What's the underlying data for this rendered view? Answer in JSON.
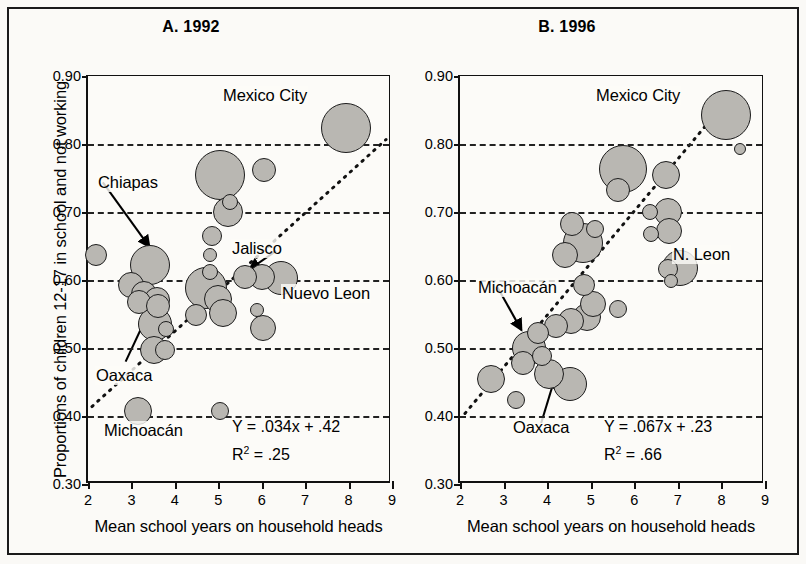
{
  "figure": {
    "ylabel": "Proportions of children 12-17 in school and not working",
    "bg_color": "#fbfaf7",
    "bubble_fill": "#b9b7b2",
    "bubble_stroke": "#1d1d1d"
  },
  "panels": {
    "a": {
      "title": "A. 1992",
      "xlabel": "Mean school years on household heads",
      "equation": "Y = .034x + .42",
      "r2_prefix": "R",
      "r2_exp": "2",
      "r2_value": " = .25",
      "ytick_labels": [
        "0.90",
        "0.80",
        "0.70",
        "0.60",
        "0.50",
        "0.40",
        "0.30"
      ],
      "xtick_labels": [
        "2",
        "3",
        "4",
        "5",
        "6",
        "7",
        "8",
        "9"
      ],
      "annotations": [
        {
          "label": "Mexico City"
        },
        {
          "label": "Chiapas"
        },
        {
          "label": "Jalisco"
        },
        {
          "label": "Nuevo Leon"
        },
        {
          "label": "Oaxaca"
        },
        {
          "label": "Michoacán"
        }
      ]
    },
    "b": {
      "title": "B. 1996",
      "xlabel": "Mean school years on household heads",
      "equation": "Y = .067x + .23",
      "r2_prefix": "R",
      "r2_exp": "2",
      "r2_value": " = .66",
      "ytick_labels": [
        "0.90",
        "0.80",
        "0.70",
        "0.60",
        "0.50",
        "0.40",
        "0.30"
      ],
      "xtick_labels": [
        "2",
        "3",
        "4",
        "5",
        "6",
        "7",
        "8",
        "9"
      ],
      "annotations": [
        {
          "label": "Mexico City"
        },
        {
          "label": "N. Leon"
        },
        {
          "label": "Michoacán"
        },
        {
          "label": "Oaxaca"
        }
      ]
    }
  },
  "chart_data": [
    {
      "type": "scatter",
      "id": "panel-a",
      "title": "A. 1992",
      "xlabel": "Mean school years on household heads",
      "ylabel": "Proportions of children 12-17 in school and not working",
      "xlim": [
        2,
        9
      ],
      "ylim": [
        0.3,
        0.9
      ],
      "xticks": [
        2,
        3,
        4,
        5,
        6,
        7,
        8,
        9
      ],
      "yticks": [
        0.3,
        0.4,
        0.5,
        0.6,
        0.7,
        0.8,
        0.9
      ],
      "grid": "horizontal-dashed",
      "legend": "none",
      "marker": "bubble (area = population size)",
      "regression": {
        "equation": "Y = .034x + .42",
        "slope": 0.034,
        "intercept": 0.42,
        "r2": 0.25,
        "style": "dotted"
      },
      "points": [
        {
          "x": 7.95,
          "y": 0.823,
          "r": 25,
          "label": "Mexico City"
        },
        {
          "x": 5.05,
          "y": 0.755,
          "r": 25
        },
        {
          "x": 6.05,
          "y": 0.762,
          "r": 12
        },
        {
          "x": 5.28,
          "y": 0.715,
          "r": 8
        },
        {
          "x": 5.22,
          "y": 0.7,
          "r": 15
        },
        {
          "x": 4.85,
          "y": 0.665,
          "r": 10
        },
        {
          "x": 4.8,
          "y": 0.637,
          "r": 7
        },
        {
          "x": 2.18,
          "y": 0.637,
          "r": 11
        },
        {
          "x": 3.42,
          "y": 0.622,
          "r": 20
        },
        {
          "x": 4.8,
          "y": 0.612,
          "r": 8
        },
        {
          "x": 5.62,
          "y": 0.605,
          "r": 12
        },
        {
          "x": 6.0,
          "y": 0.605,
          "r": 13
        },
        {
          "x": 6.45,
          "y": 0.603,
          "r": 17
        },
        {
          "x": 4.72,
          "y": 0.588,
          "r": 21,
          "label": "Jalisco"
        },
        {
          "x": 3.0,
          "y": 0.592,
          "r": 13
        },
        {
          "x": 3.28,
          "y": 0.58,
          "r": 13
        },
        {
          "x": 3.18,
          "y": 0.568,
          "r": 12,
          "label": "Chiapas"
        },
        {
          "x": 3.58,
          "y": 0.57,
          "r": 13
        },
        {
          "x": 3.62,
          "y": 0.562,
          "r": 12
        },
        {
          "x": 5.0,
          "y": 0.572,
          "r": 14
        },
        {
          "x": 5.12,
          "y": 0.552,
          "r": 14
        },
        {
          "x": 4.48,
          "y": 0.548,
          "r": 11
        },
        {
          "x": 5.88,
          "y": 0.556,
          "r": 7
        },
        {
          "x": 6.02,
          "y": 0.53,
          "r": 13,
          "label": "Nuevo Leon"
        },
        {
          "x": 3.55,
          "y": 0.535,
          "r": 17,
          "label": "Oaxaca"
        },
        {
          "x": 3.8,
          "y": 0.528,
          "r": 8
        },
        {
          "x": 3.52,
          "y": 0.497,
          "r": 14
        },
        {
          "x": 3.78,
          "y": 0.497,
          "r": 10
        },
        {
          "x": 3.15,
          "y": 0.408,
          "r": 14,
          "label": "Michoacán"
        },
        {
          "x": 5.05,
          "y": 0.407,
          "r": 9
        }
      ]
    },
    {
      "type": "scatter",
      "id": "panel-b",
      "title": "B. 1996",
      "xlabel": "Mean school years on household heads",
      "ylabel": "Proportions of children 12-17 in school and not working",
      "xlim": [
        2,
        9
      ],
      "ylim": [
        0.3,
        0.9
      ],
      "xticks": [
        2,
        3,
        4,
        5,
        6,
        7,
        8,
        9
      ],
      "yticks": [
        0.3,
        0.4,
        0.5,
        0.6,
        0.7,
        0.8,
        0.9
      ],
      "grid": "horizontal-dashed",
      "legend": "none",
      "marker": "bubble (area = population size)",
      "regression": {
        "equation": "Y = .067x + .23",
        "slope": 0.067,
        "intercept": 0.23,
        "r2": 0.66,
        "style": "dotted"
      },
      "points": [
        {
          "x": 8.1,
          "y": 0.843,
          "r": 25,
          "label": "Mexico City"
        },
        {
          "x": 8.42,
          "y": 0.793,
          "r": 6
        },
        {
          "x": 5.75,
          "y": 0.763,
          "r": 24
        },
        {
          "x": 6.72,
          "y": 0.755,
          "r": 14
        },
        {
          "x": 5.62,
          "y": 0.733,
          "r": 12
        },
        {
          "x": 6.78,
          "y": 0.7,
          "r": 14
        },
        {
          "x": 6.35,
          "y": 0.7,
          "r": 8
        },
        {
          "x": 6.8,
          "y": 0.672,
          "r": 13
        },
        {
          "x": 6.38,
          "y": 0.668,
          "r": 8
        },
        {
          "x": 5.1,
          "y": 0.675,
          "r": 9
        },
        {
          "x": 4.58,
          "y": 0.682,
          "r": 12
        },
        {
          "x": 4.82,
          "y": 0.655,
          "r": 20
        },
        {
          "x": 4.4,
          "y": 0.637,
          "r": 13
        },
        {
          "x": 7.05,
          "y": 0.618,
          "r": 18,
          "label": "N. Leon"
        },
        {
          "x": 6.78,
          "y": 0.616,
          "r": 10
        },
        {
          "x": 6.85,
          "y": 0.598,
          "r": 7
        },
        {
          "x": 4.85,
          "y": 0.592,
          "r": 11
        },
        {
          "x": 5.05,
          "y": 0.565,
          "r": 13
        },
        {
          "x": 5.62,
          "y": 0.557,
          "r": 9
        },
        {
          "x": 4.92,
          "y": 0.545,
          "r": 14
        },
        {
          "x": 4.55,
          "y": 0.54,
          "r": 13
        },
        {
          "x": 4.2,
          "y": 0.532,
          "r": 12
        },
        {
          "x": 3.78,
          "y": 0.522,
          "r": 11,
          "label": "Michoacán"
        },
        {
          "x": 3.58,
          "y": 0.5,
          "r": 17
        },
        {
          "x": 3.88,
          "y": 0.488,
          "r": 10
        },
        {
          "x": 3.45,
          "y": 0.478,
          "r": 12
        },
        {
          "x": 2.72,
          "y": 0.455,
          "r": 14
        },
        {
          "x": 4.05,
          "y": 0.462,
          "r": 15,
          "label": "Oaxaca"
        },
        {
          "x": 4.52,
          "y": 0.447,
          "r": 17
        },
        {
          "x": 3.28,
          "y": 0.423,
          "r": 9
        }
      ]
    }
  ]
}
